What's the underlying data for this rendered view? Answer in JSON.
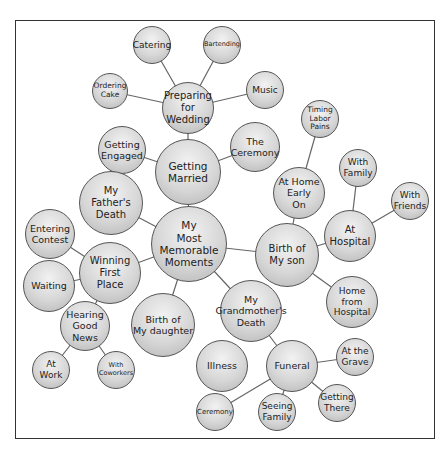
{
  "diagram": {
    "title": "My Most Memorable Moments",
    "type": "bubble-cluster-map",
    "nodes": [
      {
        "id": "center",
        "label": "My\nMost\nMemorable\nMoments",
        "x": 189,
        "y": 244,
        "r": 38,
        "fs": 10.5
      },
      {
        "id": "married",
        "label": "Getting\nMarried",
        "x": 188,
        "y": 172,
        "r": 33,
        "fs": 10.5
      },
      {
        "id": "preparing",
        "label": "Preparing\nfor\nWedding",
        "x": 188,
        "y": 108,
        "r": 26,
        "fs": 10
      },
      {
        "id": "catering",
        "label": "Catering",
        "x": 152,
        "y": 45,
        "r": 19,
        "fs": 9
      },
      {
        "id": "bartending",
        "label": "Bartending",
        "x": 222,
        "y": 45,
        "r": 19,
        "fs": 6.5
      },
      {
        "id": "cake",
        "label": "Ordering\nCake",
        "x": 110,
        "y": 91,
        "r": 18,
        "fs": 7.5
      },
      {
        "id": "music",
        "label": "Music",
        "x": 265,
        "y": 90,
        "r": 19,
        "fs": 9
      },
      {
        "id": "engaged",
        "label": "Getting\nEngaged",
        "x": 122,
        "y": 150,
        "r": 24,
        "fs": 9.5
      },
      {
        "id": "ceremony1",
        "label": "The\nCeremony",
        "x": 255,
        "y": 147,
        "r": 25,
        "fs": 9.5
      },
      {
        "id": "son",
        "label": "Birth of\nMy son",
        "x": 287,
        "y": 255,
        "r": 32,
        "fs": 10
      },
      {
        "id": "homeearly",
        "label": "At Home\nEarly\nOn",
        "x": 299,
        "y": 193,
        "r": 26,
        "fs": 9.5
      },
      {
        "id": "labor",
        "label": "Timing\nLabor\nPains",
        "x": 320,
        "y": 119,
        "r": 19,
        "fs": 7.5
      },
      {
        "id": "hospital",
        "label": "At\nHospital",
        "x": 350,
        "y": 236,
        "r": 26,
        "fs": 10
      },
      {
        "id": "family",
        "label": "With\nFamily",
        "x": 358,
        "y": 168,
        "r": 19,
        "fs": 9
      },
      {
        "id": "friends",
        "label": "With\nFriends",
        "x": 410,
        "y": 201,
        "r": 19,
        "fs": 9
      },
      {
        "id": "homefrom",
        "label": "Home from\nHospital",
        "x": 352,
        "y": 302,
        "r": 26,
        "fs": 9
      },
      {
        "id": "grandma",
        "label": "My\nGrandmother's\nDeath",
        "x": 251,
        "y": 311,
        "r": 31,
        "fs": 9.5
      },
      {
        "id": "illness",
        "label": "Illness",
        "x": 222,
        "y": 366,
        "r": 26,
        "fs": 9.5
      },
      {
        "id": "funeral",
        "label": "Funeral",
        "x": 292,
        "y": 366,
        "r": 26,
        "fs": 9.5
      },
      {
        "id": "grave",
        "label": "At the\nGrave",
        "x": 355,
        "y": 357,
        "r": 19,
        "fs": 9
      },
      {
        "id": "ceremony2",
        "label": "Ceremony",
        "x": 215,
        "y": 412,
        "r": 19,
        "fs": 7
      },
      {
        "id": "seeing",
        "label": "Seeing\nFamily",
        "x": 277,
        "y": 412,
        "r": 19,
        "fs": 9
      },
      {
        "id": "there",
        "label": "Getting\nThere",
        "x": 337,
        "y": 403,
        "r": 19,
        "fs": 9
      },
      {
        "id": "daughter",
        "label": "Birth of\nMy daughter",
        "x": 163,
        "y": 325,
        "r": 32,
        "fs": 9.5
      },
      {
        "id": "father",
        "label": "My\nFather's\nDeath",
        "x": 111,
        "y": 203,
        "r": 32,
        "fs": 10
      },
      {
        "id": "winning",
        "label": "Winning\nFirst\nPlace",
        "x": 110,
        "y": 273,
        "r": 31,
        "fs": 10
      },
      {
        "id": "contest",
        "label": "Entering\nContest",
        "x": 50,
        "y": 234,
        "r": 25,
        "fs": 9.5
      },
      {
        "id": "waiting",
        "label": "Waiting",
        "x": 49,
        "y": 286,
        "r": 26,
        "fs": 9.5
      },
      {
        "id": "hearing",
        "label": "Hearing\nGood\nNews",
        "x": 85,
        "y": 326,
        "r": 25,
        "fs": 9.5
      },
      {
        "id": "work",
        "label": "At\nWork",
        "x": 51,
        "y": 370,
        "r": 19,
        "fs": 9
      },
      {
        "id": "coworkers",
        "label": "With\nCoworkers",
        "x": 116,
        "y": 370,
        "r": 19,
        "fs": 6.5
      }
    ],
    "edges": [
      [
        "center",
        "married"
      ],
      [
        "married",
        "preparing"
      ],
      [
        "preparing",
        "catering"
      ],
      [
        "preparing",
        "bartending"
      ],
      [
        "preparing",
        "cake"
      ],
      [
        "preparing",
        "music"
      ],
      [
        "married",
        "engaged"
      ],
      [
        "married",
        "ceremony1"
      ],
      [
        "center",
        "son"
      ],
      [
        "son",
        "homeearly"
      ],
      [
        "homeearly",
        "labor"
      ],
      [
        "son",
        "hospital"
      ],
      [
        "hospital",
        "family"
      ],
      [
        "hospital",
        "friends"
      ],
      [
        "son",
        "homefrom"
      ],
      [
        "center",
        "grandma"
      ],
      [
        "grandma",
        "funeral"
      ],
      [
        "funeral",
        "grave"
      ],
      [
        "funeral",
        "ceremony2"
      ],
      [
        "funeral",
        "seeing"
      ],
      [
        "funeral",
        "there"
      ],
      [
        "center",
        "daughter"
      ],
      [
        "center",
        "father"
      ],
      [
        "center",
        "winning"
      ],
      [
        "winning",
        "contest"
      ],
      [
        "winning",
        "waiting"
      ],
      [
        "winning",
        "hearing"
      ],
      [
        "hearing",
        "work"
      ],
      [
        "hearing",
        "coworkers"
      ]
    ]
  }
}
